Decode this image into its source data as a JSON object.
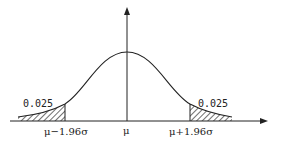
{
  "diagram": {
    "type": "normal-distribution-two-tailed",
    "labels": {
      "left_tail_area": "0.025",
      "right_tail_area": "0.025",
      "left_bound": "μ−1.96σ",
      "center": "μ",
      "right_bound": "μ+1.96σ"
    },
    "colors": {
      "stroke": "#222222",
      "background": "#ffffff"
    }
  }
}
